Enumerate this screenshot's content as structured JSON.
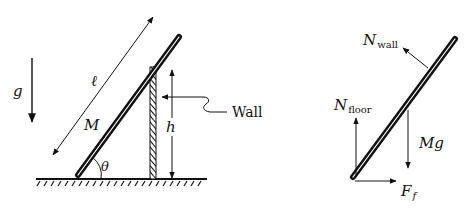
{
  "figure": {
    "left_panel": {
      "title": "Ladder leaning on wall",
      "labels": {
        "gravity": "g",
        "length": "ℓ",
        "mass": "M",
        "angle": "θ",
        "height": "h",
        "wall": "Wall"
      }
    },
    "right_panel": {
      "title": "Free-body diagram",
      "labels": {
        "n_wall_main": "N",
        "n_wall_sub": "wall",
        "n_floor_main": "N",
        "n_floor_sub": "floor",
        "weight": "Mg",
        "friction_main": "F",
        "friction_sub": "f"
      }
    },
    "colors": {
      "ink": "#111111",
      "background": "#ffffff"
    }
  }
}
